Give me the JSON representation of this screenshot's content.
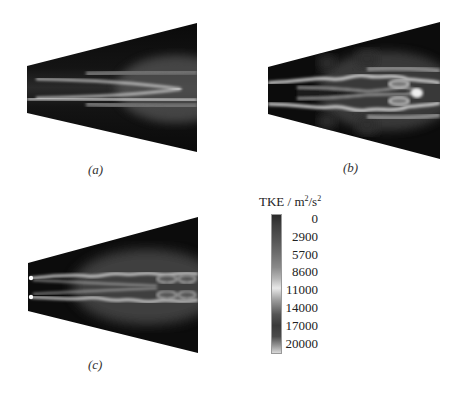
{
  "figure": {
    "panels": [
      {
        "id": "a",
        "caption": "(a)",
        "description": "Single-orifice jet TKE contour, two straight shear layers converging downstream"
      },
      {
        "id": "b",
        "caption": "(b)",
        "description": "TKE contour with wavy shear layers and vortex cells near outlet"
      },
      {
        "id": "c",
        "caption": "(c)",
        "description": "TKE contour with wavy shear layers along full length"
      }
    ],
    "colorbar": {
      "title": "TKE / m",
      "title_sup1": "2",
      "title_mid": "/s",
      "title_sup2": "2",
      "ticks": [
        "0",
        "2900",
        "5700",
        "8600",
        "11000",
        "14000",
        "17000",
        "20000"
      ]
    }
  }
}
